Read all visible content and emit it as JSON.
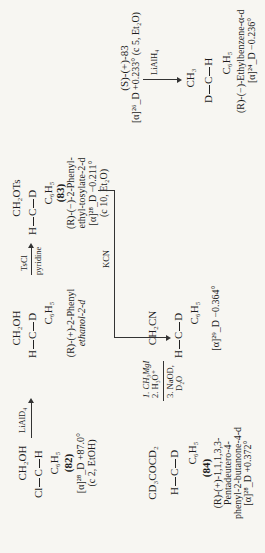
{
  "compounds": {
    "c82": {
      "top": "CH₂OH",
      "left": "Cl",
      "center": "C",
      "right": "H",
      "bottom": "C₆H₅",
      "number": "(82)",
      "rotation": "[α]²⁸_D +87.0°",
      "conditions": "(c 2, EtOH)"
    },
    "phenylethanol": {
      "top": "CH₂OH",
      "left": "H",
      "center": "C",
      "right": "D",
      "bottom": "C₆H₅",
      "name_line1": "(R)-(+)-2-Phenyl",
      "name_line2": "ethanol-2-d"
    },
    "c83": {
      "top": "CH₂OTs",
      "left": "H",
      "center": "C",
      "right": "D",
      "bottom": "C₆H₅",
      "number": "(83)",
      "name_line1": "(R)-(−)-2-Phenyl-",
      "name_line2": "ethyl-tosylate-2-d",
      "rotation": "[α]²⁸_D −0.211°",
      "conditions": "(c 10, Et₂O)"
    },
    "nitrile": {
      "top": "CH₂CN",
      "left": "H",
      "center": "C",
      "right": "D",
      "bottom": "C₆H₅",
      "rotation": "[α]²⁹_D −0.364°"
    },
    "c84": {
      "top": "CD₃COCD₂",
      "left": "H",
      "center": "C",
      "right": "D",
      "bottom": "C₆H₅",
      "number": "(84)",
      "name_line1": "(R)-(+)-1,1,1,3,3-",
      "name_line2": "Pentadeutero-4-",
      "name_line3": "phenyl-2-butanone-4-d",
      "rotation": "[α]²⁸_D +0.372°"
    },
    "s83": {
      "label": "(S)-(+)-83",
      "rotation": "[α]²⁶_D +0.233° (c 5, Et₂O)"
    },
    "ethylbenzene": {
      "top": "CH₃",
      "left": "D",
      "center": "C",
      "right": "H",
      "bottom": "C₆H₅",
      "name": "(R)-(−)-Ethylbenzene-α-d",
      "rotation": "[α]²⁴_D −0.236°"
    }
  },
  "reagents": {
    "step1": "LiAlD₄",
    "step2_top": "TsCl",
    "step2_bottom": "pyridine",
    "step3": "KCN",
    "step4_1": "1. CH₃MgI",
    "step4_2": "2. H₃O⁺",
    "step4_3": "3. NaOD,",
    "step4_4": "D₂O",
    "step5": "LiAlH₄"
  }
}
